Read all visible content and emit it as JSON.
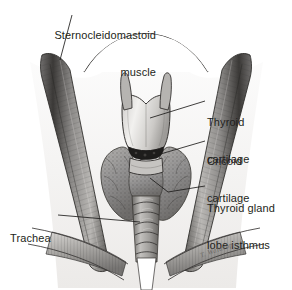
{
  "figure": {
    "ink_color": "#231f20",
    "background": "#ffffff"
  },
  "labels": {
    "sternocleidomastoid": {
      "line1": "Sternocleidomastoid",
      "line2": "muscle",
      "full": "Sternocleidomastoid muscle"
    },
    "thyroid_cartilage": {
      "line1": "Thyroid",
      "line2": "cartilage",
      "full": "Thyroid cartilage"
    },
    "cricoid_cartilage": {
      "line1": "Cricoid",
      "line2": "cartilage",
      "full": "Cricoid cartilage"
    },
    "thyroid_gland": {
      "line1": "Thyroid gland",
      "line2": "lobe isthmus",
      "full": "Thyroid gland lobe isthmus"
    },
    "trachea": {
      "line1": "Trachea",
      "full": "Trachea"
    }
  },
  "signature": {
    "text": "T. Waldrop"
  },
  "structures": [
    {
      "name": "chin-jawline",
      "side": "center"
    },
    {
      "name": "sternocleidomastoid-muscle",
      "side": "left"
    },
    {
      "name": "sternocleidomastoid-muscle",
      "side": "right"
    },
    {
      "name": "thyroid-cartilage",
      "side": "center"
    },
    {
      "name": "superior-horn",
      "side": "left"
    },
    {
      "name": "superior-horn",
      "side": "right"
    },
    {
      "name": "cricothyroid-membrane",
      "side": "center"
    },
    {
      "name": "cricoid-cartilage",
      "side": "center"
    },
    {
      "name": "thyroid-gland-lobe",
      "side": "left"
    },
    {
      "name": "thyroid-gland-lobe",
      "side": "right"
    },
    {
      "name": "thyroid-isthmus",
      "side": "center"
    },
    {
      "name": "trachea",
      "side": "center"
    },
    {
      "name": "strap-muscles",
      "side": "left"
    },
    {
      "name": "strap-muscles",
      "side": "right"
    },
    {
      "name": "clavicle",
      "side": "left"
    },
    {
      "name": "clavicle",
      "side": "right"
    },
    {
      "name": "suprasternal-notch",
      "side": "center"
    }
  ]
}
